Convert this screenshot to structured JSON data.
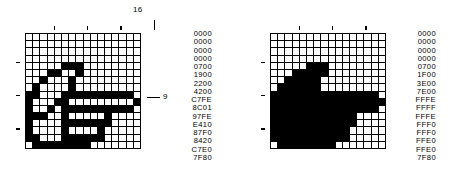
{
  "figure": {
    "colors": {
      "ink": "#000000",
      "paper": "#ffffff"
    },
    "grid_size": {
      "cols": 16,
      "rows": 16
    }
  },
  "panels": [
    {
      "id": "left",
      "name": "cursor-shape-grid",
      "top_axis_label": "16",
      "row_callout": "9",
      "top_ticks": [
        4,
        8,
        12,
        16
      ],
      "left_ticks": [
        4,
        8,
        12
      ],
      "hex_values": [
        "0000",
        "0000",
        "0000",
        "0000",
        "0700",
        "1900",
        "2200",
        "4200",
        "C7FE",
        "8C01",
        "97FE",
        "E410",
        "87F0",
        "8420",
        "C7E0",
        "7F80"
      ]
    },
    {
      "id": "right",
      "name": "cursor-mask-grid",
      "top_axis_label": "",
      "row_callout": "",
      "top_ticks": [
        4,
        8,
        12
      ],
      "left_ticks": [
        4,
        8,
        12
      ],
      "hex_values": [
        "0000",
        "0000",
        "0000",
        "0000",
        "0700",
        "1F00",
        "3E00",
        "7E00",
        "FFFE",
        "FFFF",
        "FFFE",
        "FFF0",
        "FFF0",
        "FFE0",
        "FFE0",
        "7F80"
      ]
    }
  ]
}
